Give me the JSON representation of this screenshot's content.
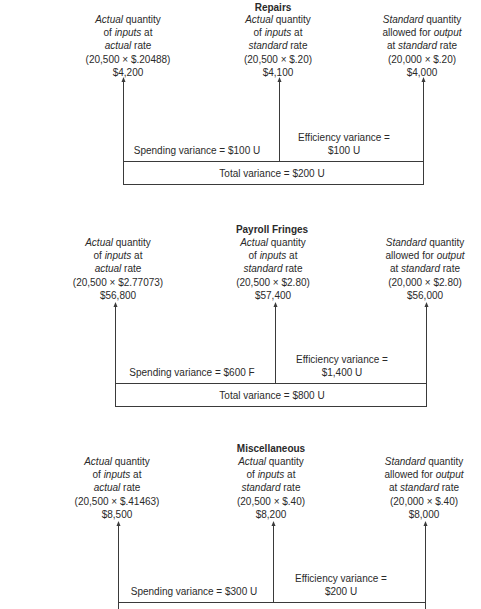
{
  "diagrams": [
    {
      "title": "Repairs",
      "columns": [
        {
          "lines": [
            [
              {
                "t": "Actual",
                "i": true
              },
              {
                "t": " quantity",
                "i": false
              }
            ],
            [
              {
                "t": "of ",
                "i": false
              },
              {
                "t": "inputs",
                "i": true
              },
              {
                "t": " at",
                "i": false
              }
            ],
            [
              {
                "t": "actual",
                "i": true
              },
              {
                "t": " rate",
                "i": false
              }
            ],
            [
              {
                "t": "(20,500 × $.20488)",
                "i": false
              }
            ],
            [
              {
                "t": "$4,200",
                "i": false
              }
            ]
          ]
        },
        {
          "lines": [
            [
              {
                "t": "Actual",
                "i": true
              },
              {
                "t": " quantity",
                "i": false
              }
            ],
            [
              {
                "t": "of ",
                "i": false
              },
              {
                "t": "inputs",
                "i": true
              },
              {
                "t": " at",
                "i": false
              }
            ],
            [
              {
                "t": "standard",
                "i": true
              },
              {
                "t": " rate",
                "i": false
              }
            ],
            [
              {
                "t": "(20,500 × $.20)",
                "i": false
              }
            ],
            [
              {
                "t": "$4,100",
                "i": false
              }
            ]
          ]
        },
        {
          "lines": [
            [
              {
                "t": "Standard",
                "i": true
              },
              {
                "t": " quantity",
                "i": false
              }
            ],
            [
              {
                "t": "allowed for ",
                "i": false
              },
              {
                "t": "output",
                "i": true
              }
            ],
            [
              {
                "t": "at ",
                "i": false
              },
              {
                "t": "standard",
                "i": true
              },
              {
                "t": " rate",
                "i": false
              }
            ],
            [
              {
                "t": "(20,000 × $.20)",
                "i": false
              }
            ],
            [
              {
                "t": "$4,000",
                "i": false
              }
            ]
          ]
        }
      ],
      "spending_variance": "Spending variance = $100 U",
      "efficiency_variance_line1": "Efficiency variance =",
      "efficiency_variance_line2": "$100 U",
      "total_variance": "Total variance = $200 U"
    },
    {
      "title": "Payroll Fringes",
      "columns": [
        {
          "lines": [
            [
              {
                "t": "Actual",
                "i": true
              },
              {
                "t": " quantity",
                "i": false
              }
            ],
            [
              {
                "t": "of ",
                "i": false
              },
              {
                "t": "inputs",
                "i": true
              },
              {
                "t": " at",
                "i": false
              }
            ],
            [
              {
                "t": "actual",
                "i": true
              },
              {
                "t": " rate",
                "i": false
              }
            ],
            [
              {
                "t": "(20,500 × $2.77073)",
                "i": false
              }
            ],
            [
              {
                "t": "$56,800",
                "i": false
              }
            ]
          ]
        },
        {
          "lines": [
            [
              {
                "t": "Actual",
                "i": true
              },
              {
                "t": " quantity",
                "i": false
              }
            ],
            [
              {
                "t": "of ",
                "i": false
              },
              {
                "t": "inputs",
                "i": true
              },
              {
                "t": " at",
                "i": false
              }
            ],
            [
              {
                "t": "standard",
                "i": true
              },
              {
                "t": " rate",
                "i": false
              }
            ],
            [
              {
                "t": "(20,500 × $2.80)",
                "i": false
              }
            ],
            [
              {
                "t": "$57,400",
                "i": false
              }
            ]
          ]
        },
        {
          "lines": [
            [
              {
                "t": "Standard",
                "i": true
              },
              {
                "t": " quantity",
                "i": false
              }
            ],
            [
              {
                "t": "allowed for ",
                "i": false
              },
              {
                "t": "output",
                "i": true
              }
            ],
            [
              {
                "t": "at ",
                "i": false
              },
              {
                "t": "standard",
                "i": true
              },
              {
                "t": " rate",
                "i": false
              }
            ],
            [
              {
                "t": "(20,000 × $2.80)",
                "i": false
              }
            ],
            [
              {
                "t": "$56,000",
                "i": false
              }
            ]
          ]
        }
      ],
      "spending_variance": "Spending variance = $600 F",
      "efficiency_variance_line1": "Efficiency variance =",
      "efficiency_variance_line2": "$1,400 U",
      "total_variance": "Total variance = $800 U"
    },
    {
      "title": "Miscellaneous",
      "columns": [
        {
          "lines": [
            [
              {
                "t": "Actual",
                "i": true
              },
              {
                "t": " quantity",
                "i": false
              }
            ],
            [
              {
                "t": "of ",
                "i": false
              },
              {
                "t": "inputs",
                "i": true
              },
              {
                "t": " at",
                "i": false
              }
            ],
            [
              {
                "t": "actual",
                "i": true
              },
              {
                "t": " rate",
                "i": false
              }
            ],
            [
              {
                "t": "(20,500 × $.41463)",
                "i": false
              }
            ],
            [
              {
                "t": "$8,500",
                "i": false
              }
            ]
          ]
        },
        {
          "lines": [
            [
              {
                "t": "Actual",
                "i": true
              },
              {
                "t": " quantity",
                "i": false
              }
            ],
            [
              {
                "t": "of ",
                "i": false
              },
              {
                "t": "inputs",
                "i": true
              },
              {
                "t": " at",
                "i": false
              }
            ],
            [
              {
                "t": "standard",
                "i": true
              },
              {
                "t": " rate",
                "i": false
              }
            ],
            [
              {
                "t": "(20,500 × $.40)",
                "i": false
              }
            ],
            [
              {
                "t": "$8,200",
                "i": false
              }
            ]
          ]
        },
        {
          "lines": [
            [
              {
                "t": "Standard",
                "i": true
              },
              {
                "t": " quantity",
                "i": false
              }
            ],
            [
              {
                "t": "allowed for ",
                "i": false
              },
              {
                "t": "output",
                "i": true
              }
            ],
            [
              {
                "t": "at ",
                "i": false
              },
              {
                "t": "standard",
                "i": true
              },
              {
                "t": " rate",
                "i": false
              }
            ],
            [
              {
                "t": "(20,000 × $.40)",
                "i": false
              }
            ],
            [
              {
                "t": "$8,000",
                "i": false
              }
            ]
          ]
        }
      ],
      "spending_variance": "Spending variance = $300 U",
      "efficiency_variance_line1": "Efficiency variance =",
      "efficiency_variance_line2": "$200 U",
      "total_variance": ""
    }
  ],
  "colors": {
    "line": "#3a3a3a",
    "text": "#2a2a2a",
    "background": "#ffffff"
  }
}
